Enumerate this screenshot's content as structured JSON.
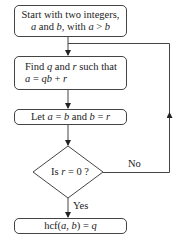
{
  "flowchart": {
    "start": {
      "line1": "Start with two integers,",
      "line2_parts": [
        "a",
        " and ",
        "b",
        ", with ",
        "a",
        " > ",
        "b"
      ]
    },
    "find": {
      "line1_parts": [
        "Find ",
        "q",
        " and ",
        "r",
        " such that"
      ],
      "line2_parts": [
        "a",
        " = ",
        "qb",
        " + ",
        "r"
      ]
    },
    "assign": {
      "parts": [
        "Let ",
        "a",
        " = ",
        "b",
        " and ",
        "b",
        " = ",
        "r"
      ]
    },
    "decision": {
      "parts": [
        "Is ",
        "r",
        " = 0 ?"
      ]
    },
    "result": {
      "parts": [
        "hcf(",
        "a",
        ", ",
        "b",
        ") = ",
        "q"
      ]
    },
    "edges": {
      "no_label": "No",
      "yes_label": "Yes"
    }
  }
}
